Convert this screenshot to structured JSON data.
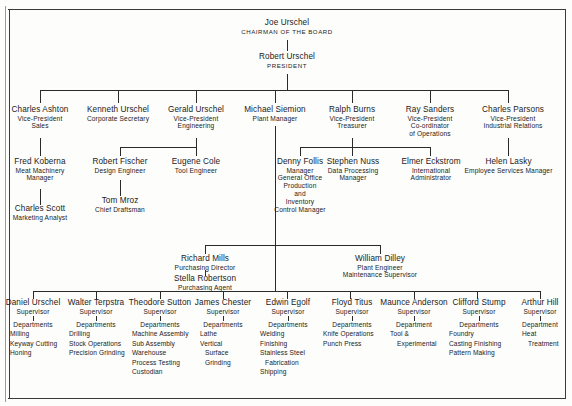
{
  "chart": {
    "type": "org-chart"
  },
  "top": {
    "chairman": {
      "name": "Joe Urschel",
      "title": "CHAIRMAN OF THE BOARD"
    },
    "president": {
      "name": "Robert Urschel",
      "title": "PRESIDENT"
    }
  },
  "executives": [
    {
      "name": "Charles Ashton",
      "title1": "Vice-President",
      "title2": "Sales"
    },
    {
      "name": "Kenneth Urschel",
      "title1": "Corporate Secretary",
      "title2": ""
    },
    {
      "name": "Gerald Urschel",
      "title1": "Vice-President",
      "title2": "Engineering"
    },
    {
      "name": "Michael Siemion",
      "title1": "Plant Manager",
      "title2": ""
    },
    {
      "name": "Ralph Burns",
      "title1": "Vice-President",
      "title2": "Treasurer"
    },
    {
      "name": "Ray Sanders",
      "title1": "Vice-President",
      "title2": "Co-ordinator",
      "title3": "of Operations"
    },
    {
      "name": "Charles Parsons",
      "title1": "Vice-President",
      "title2": "Industrial Relations"
    }
  ],
  "managers": {
    "koberna": {
      "name": "Fred Koberna",
      "title1": "Meat Machinery",
      "title2": "Manager"
    },
    "scott": {
      "name": "Charles Scott",
      "title1": "Marketing Analyst"
    },
    "fischer": {
      "name": "Robert Fischer",
      "title1": "Design Engineer"
    },
    "mroz": {
      "name": "Tom Mroz",
      "title1": "Chief Draftsman"
    },
    "cole": {
      "name": "Eugene Cole",
      "title1": "Tool Engineer"
    },
    "follis": {
      "name": "Denny Follis",
      "lines": [
        "Manager",
        "General Office",
        "Production",
        "and",
        "Inventory",
        "Control Manager"
      ]
    },
    "nuss": {
      "name": "Stephen Nuss",
      "title1": "Data Processing",
      "title2": "Manager"
    },
    "eckstrom": {
      "name": "Elmer Eckstrom",
      "title1": "International",
      "title2": "Administrator"
    },
    "lasky": {
      "name": "Helen Lasky",
      "title1": "Employee Services Manager"
    },
    "mills": {
      "name": "Richard Mills",
      "title1": "Purchasing Director"
    },
    "robertson": {
      "name": "Stella Robertson",
      "title1": "Purchasing Agent"
    },
    "dilley": {
      "name": "William Dilley",
      "title1": "Plant Engineer",
      "title2": "Maintenance Supervisor"
    }
  },
  "supervisors": [
    {
      "name": "Daniel Urschel",
      "role": "Supervisor",
      "dept_label": "Departments",
      "departments": [
        "Milling",
        "Keyway Cutting",
        "Honing"
      ]
    },
    {
      "name": "Walter Terpstra",
      "role": "Supervisor",
      "dept_label": "Departments",
      "departments": [
        "Drilling",
        "Stock Operations",
        "Precision Grinding"
      ]
    },
    {
      "name": "Theodore Sutton",
      "role": "Supervisor",
      "dept_label": "Departments",
      "departments": [
        "Machine Assembly",
        "Sub Assembly",
        "Warehouse",
        "Process Testing",
        "Custodian"
      ]
    },
    {
      "name": "James Chester",
      "role": "Supervisor",
      "dept_label": "Departments",
      "departments": [
        "Lathe",
        "Vertical",
        "Surface",
        "Grinding"
      ]
    },
    {
      "name": "Edwin Egolf",
      "role": "Supervisor",
      "dept_label": "Departments",
      "departments": [
        "Welding",
        "Finishing",
        "Stainless Steel",
        "Fabrication",
        "Shipping"
      ]
    },
    {
      "name": "Floyd Titus",
      "role": "Supervisor",
      "dept_label": "Departments",
      "departments": [
        "Knife Operations",
        "Punch Press"
      ]
    },
    {
      "name": "Maunce Anderson",
      "role": "Supervisor",
      "dept_label": "Department",
      "departments": [
        "Tool &",
        "Experimental"
      ]
    },
    {
      "name": "Clifford Stump",
      "role": "Supervisor",
      "dept_label": "Departments",
      "departments": [
        "Foundry",
        "Casting Finishing",
        "Pattern Making"
      ]
    },
    {
      "name": "Arthur Hill",
      "role": "Supervisor",
      "dept_label": "Department",
      "departments": [
        "Heat",
        "Treatment"
      ]
    }
  ],
  "colors": {
    "ink": "#1b1b1b",
    "line": "#2a2a2a",
    "page": "#fdfdfc"
  }
}
